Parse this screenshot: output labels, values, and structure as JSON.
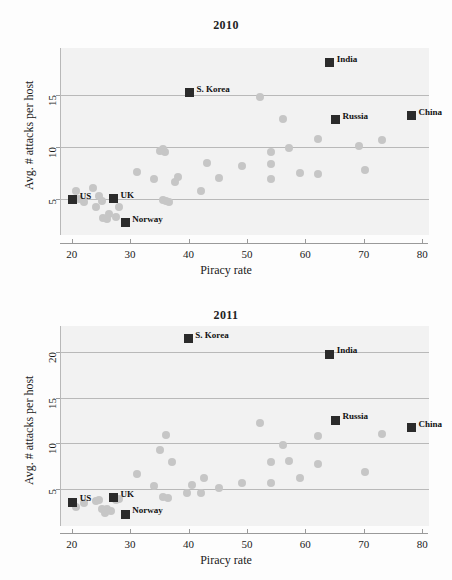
{
  "figure": {
    "background_color": "#fdfdfd",
    "plot_background_color": "#f2f2f2",
    "gridline_color": "#b9b9b9",
    "marker_color": "#c6c6c6",
    "highlight_marker_color": "#2b2b2b"
  },
  "chart_data": [
    {
      "type": "scatter",
      "title": "2010",
      "xlabel": "Piracy rate",
      "ylabel": "Avg. # attacks per host",
      "xlim": [
        18,
        81
      ],
      "ylim": [
        1.5,
        19.5
      ],
      "xticks": [
        20,
        30,
        40,
        50,
        60,
        70,
        80
      ],
      "yticks": [
        5,
        10,
        15
      ],
      "grid": "horizontal",
      "legend": "none",
      "series": [
        {
          "name": "countries",
          "points": [
            {
              "x": 20.5,
              "y": 5.7
            },
            {
              "x": 21.0,
              "y": 5.0
            },
            {
              "x": 22.0,
              "y": 4.7
            },
            {
              "x": 23.5,
              "y": 6.0
            },
            {
              "x": 24.0,
              "y": 4.2
            },
            {
              "x": 24.5,
              "y": 5.3
            },
            {
              "x": 25.0,
              "y": 4.8
            },
            {
              "x": 25.2,
              "y": 3.1
            },
            {
              "x": 25.8,
              "y": 3.0
            },
            {
              "x": 26.2,
              "y": 3.5
            },
            {
              "x": 27.5,
              "y": 3.2
            },
            {
              "x": 28.0,
              "y": 4.2
            },
            {
              "x": 31.0,
              "y": 7.6
            },
            {
              "x": 34.0,
              "y": 6.9
            },
            {
              "x": 35.0,
              "y": 9.6
            },
            {
              "x": 35.5,
              "y": 9.8
            },
            {
              "x": 35.8,
              "y": 9.5
            },
            {
              "x": 35.5,
              "y": 4.9
            },
            {
              "x": 36.0,
              "y": 4.8
            },
            {
              "x": 36.5,
              "y": 4.7
            },
            {
              "x": 37.5,
              "y": 6.6
            },
            {
              "x": 38.0,
              "y": 7.1
            },
            {
              "x": 42.0,
              "y": 5.7
            },
            {
              "x": 43.0,
              "y": 8.4
            },
            {
              "x": 45.0,
              "y": 7.0
            },
            {
              "x": 49.0,
              "y": 8.1
            },
            {
              "x": 52.0,
              "y": 14.8
            },
            {
              "x": 54.0,
              "y": 9.5
            },
            {
              "x": 54.0,
              "y": 8.3
            },
            {
              "x": 54.0,
              "y": 6.9
            },
            {
              "x": 56.0,
              "y": 12.7
            },
            {
              "x": 57.0,
              "y": 9.9
            },
            {
              "x": 59.0,
              "y": 7.5
            },
            {
              "x": 62.0,
              "y": 10.7
            },
            {
              "x": 62.0,
              "y": 7.4
            },
            {
              "x": 69.0,
              "y": 10.1
            },
            {
              "x": 70.0,
              "y": 7.8
            },
            {
              "x": 73.0,
              "y": 10.6
            }
          ]
        }
      ],
      "highlights": [
        {
          "label": "US",
          "x": 20.0,
          "y": 4.9
        },
        {
          "label": "UK",
          "x": 27.0,
          "y": 5.0
        },
        {
          "label": "Norway",
          "x": 29.0,
          "y": 2.7
        },
        {
          "label": "S. Korea",
          "x": 40.0,
          "y": 15.2
        },
        {
          "label": "India",
          "x": 64.0,
          "y": 18.1
        },
        {
          "label": "Russia",
          "x": 65.0,
          "y": 12.6
        },
        {
          "label": "China",
          "x": 78.0,
          "y": 13.0
        }
      ]
    },
    {
      "type": "scatter",
      "title": "2011",
      "xlabel": "Piracy rate",
      "ylabel": "Avg. # attacks per host",
      "xlim": [
        18,
        81
      ],
      "ylim": [
        1.0,
        22.8
      ],
      "xticks": [
        20,
        30,
        40,
        50,
        60,
        70,
        80
      ],
      "yticks": [
        5,
        10,
        15,
        20
      ],
      "grid": "horizontal",
      "legend": "none",
      "series": [
        {
          "name": "countries",
          "points": [
            {
              "x": 20.5,
              "y": 3.1
            },
            {
              "x": 22.0,
              "y": 3.5
            },
            {
              "x": 24.0,
              "y": 3.7
            },
            {
              "x": 24.5,
              "y": 3.8
            },
            {
              "x": 25.0,
              "y": 2.9
            },
            {
              "x": 25.5,
              "y": 2.4
            },
            {
              "x": 25.8,
              "y": 2.8
            },
            {
              "x": 26.5,
              "y": 2.6
            },
            {
              "x": 27.5,
              "y": 3.8
            },
            {
              "x": 28.0,
              "y": 3.9
            },
            {
              "x": 31.0,
              "y": 6.7
            },
            {
              "x": 34.0,
              "y": 5.4
            },
            {
              "x": 35.0,
              "y": 9.3
            },
            {
              "x": 35.5,
              "y": 4.2
            },
            {
              "x": 36.0,
              "y": 10.9
            },
            {
              "x": 36.3,
              "y": 4.0
            },
            {
              "x": 37.0,
              "y": 8.0
            },
            {
              "x": 39.5,
              "y": 4.6
            },
            {
              "x": 40.5,
              "y": 5.5
            },
            {
              "x": 42.0,
              "y": 4.6
            },
            {
              "x": 42.5,
              "y": 6.2
            },
            {
              "x": 45.0,
              "y": 5.1
            },
            {
              "x": 49.0,
              "y": 5.7
            },
            {
              "x": 52.0,
              "y": 12.2
            },
            {
              "x": 54.0,
              "y": 8.0
            },
            {
              "x": 54.0,
              "y": 5.7
            },
            {
              "x": 56.0,
              "y": 9.8
            },
            {
              "x": 57.0,
              "y": 8.1
            },
            {
              "x": 59.0,
              "y": 6.2
            },
            {
              "x": 62.0,
              "y": 10.8
            },
            {
              "x": 62.0,
              "y": 7.8
            },
            {
              "x": 70.0,
              "y": 6.9
            },
            {
              "x": 73.0,
              "y": 11.0
            }
          ]
        }
      ],
      "highlights": [
        {
          "label": "US",
          "x": 20.0,
          "y": 3.6
        },
        {
          "label": "UK",
          "x": 27.0,
          "y": 4.1
        },
        {
          "label": "Norway",
          "x": 29.0,
          "y": 2.3
        },
        {
          "label": "S. Korea",
          "x": 39.8,
          "y": 21.4
        },
        {
          "label": "India",
          "x": 64.0,
          "y": 19.7
        },
        {
          "label": "Russia",
          "x": 65.0,
          "y": 12.5
        },
        {
          "label": "China",
          "x": 78.0,
          "y": 11.7
        }
      ]
    }
  ]
}
